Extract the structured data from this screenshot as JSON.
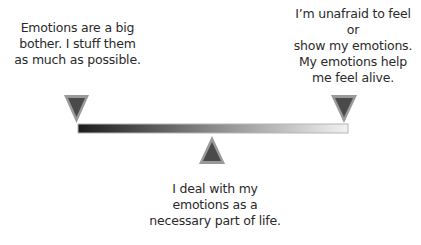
{
  "diagram": {
    "type": "emotional-scale",
    "labels": {
      "left": "Emotions are a big\nbother. I stuff them\nas much as possible.",
      "right": "I’m unafraid to feel or\nshow my emotions.\nMy emotions help\nme feel alive.",
      "middle": "I deal with my\nemotions as a\nnecessary part of life."
    },
    "markers": [
      {
        "name": "left-end",
        "position": 0,
        "direction": "down"
      },
      {
        "name": "middle",
        "position": 0.5,
        "direction": "up"
      },
      {
        "name": "right-end",
        "position": 1,
        "direction": "down"
      }
    ],
    "colors": {
      "bar_start": "#1c1c1c",
      "bar_end": "#f2f2f2",
      "marker_fill": "#4a4a4a",
      "marker_edge": "#9a9a9a",
      "bar_outline": "#b5b5b5"
    }
  }
}
